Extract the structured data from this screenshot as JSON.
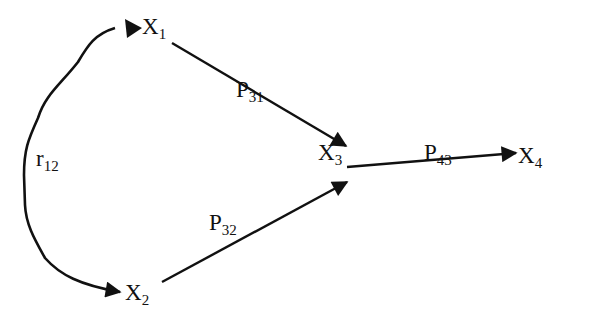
{
  "diagram": {
    "type": "path-diagram",
    "colors": {
      "background": "#ffffff",
      "ink": "#111111"
    },
    "nodes": [
      {
        "id": "X1",
        "base": "X",
        "sub": "1"
      },
      {
        "id": "X2",
        "base": "X",
        "sub": "2"
      },
      {
        "id": "X3",
        "base": "X",
        "sub": "3"
      },
      {
        "id": "X4",
        "base": "X",
        "sub": "4"
      }
    ],
    "edges": [
      {
        "from": "X1",
        "to": "X3",
        "base": "P",
        "sub": "31",
        "kind": "path"
      },
      {
        "from": "X2",
        "to": "X3",
        "base": "P",
        "sub": "32",
        "kind": "path"
      },
      {
        "from": "X3",
        "to": "X4",
        "base": "P",
        "sub": "43",
        "kind": "path"
      },
      {
        "from": "X1",
        "to": "X2",
        "base": "r",
        "sub": "12",
        "kind": "correlation",
        "bidirectional": true
      }
    ]
  }
}
